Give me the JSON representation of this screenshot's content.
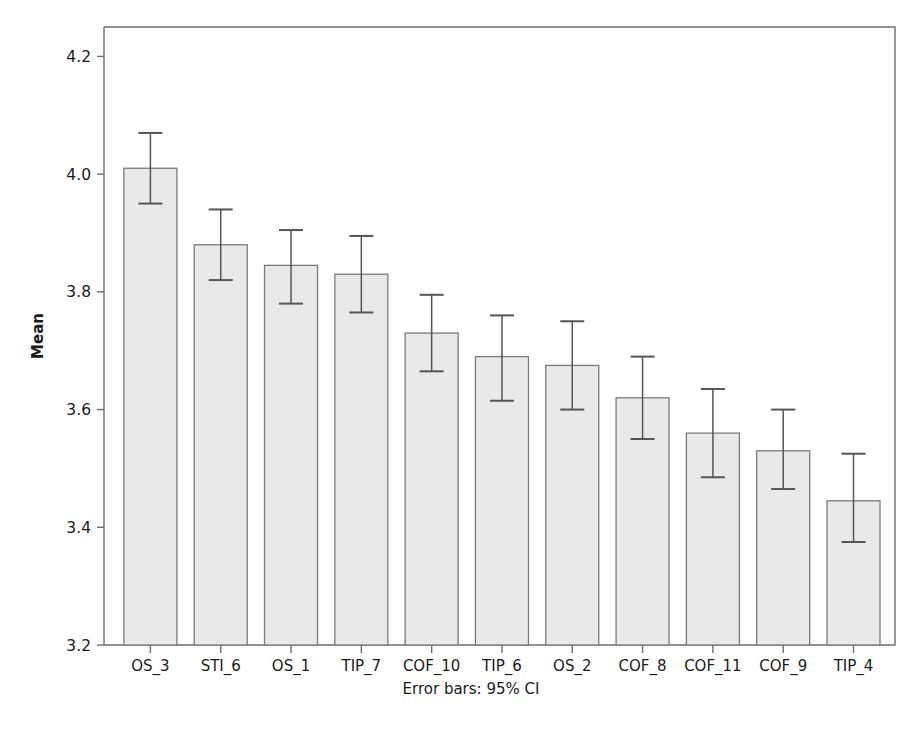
{
  "chart_data": {
    "type": "bar",
    "title": "",
    "subtitle": "",
    "xlabel": "",
    "ylabel": "Mean",
    "annotation": "Error bars: 95% CI",
    "categories": [
      "OS_3",
      "STI_6",
      "OS_1",
      "TIP_7",
      "COF_10",
      "TIP_6",
      "OS_2",
      "COF_8",
      "COF_11",
      "COF_9",
      "TIP_4"
    ],
    "values": [
      4.01,
      3.88,
      3.845,
      3.83,
      3.73,
      3.69,
      3.675,
      3.62,
      3.56,
      3.53,
      3.445
    ],
    "error_low": [
      3.95,
      3.82,
      3.78,
      3.765,
      3.665,
      3.615,
      3.6,
      3.55,
      3.485,
      3.465,
      3.375
    ],
    "error_high": [
      4.07,
      3.94,
      3.905,
      3.895,
      3.795,
      3.76,
      3.75,
      3.69,
      3.635,
      3.6,
      3.525
    ],
    "ylim": [
      3.2,
      4.25
    ],
    "yticks": [
      3.2,
      3.4,
      3.6,
      3.8,
      4.0,
      4.2
    ],
    "ytick_labels": [
      "3.2",
      "3.4",
      "3.6",
      "3.8",
      "4.0",
      "4.2"
    ],
    "grid": false,
    "legend": "none",
    "bar_fill": "#e9e9e9",
    "bar_stroke": "#7a7a7a",
    "error_color": "#555555",
    "axis_color": "#6e6e6e"
  }
}
